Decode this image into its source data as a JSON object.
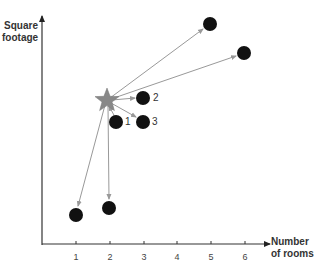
{
  "axes": {
    "y_label_line1": "Square",
    "y_label_line2": "footage",
    "x_label_line1": "Number",
    "x_label_line2": "of rooms",
    "x_ticks": [
      "1",
      "2",
      "3",
      "4",
      "5",
      "6"
    ]
  },
  "query_point": {
    "shape": "star",
    "color": "#888888",
    "x": 1.9,
    "note": "new data point"
  },
  "neighbor_labels": [
    "1",
    "2",
    "3"
  ],
  "points": [
    {
      "id": "top-right-a",
      "x": 5,
      "label": ""
    },
    {
      "id": "top-right-b",
      "x": 6,
      "label": ""
    },
    {
      "id": "neighbor-2",
      "x": 3,
      "label": "2"
    },
    {
      "id": "neighbor-1",
      "x": 2.2,
      "label": "1"
    },
    {
      "id": "neighbor-3",
      "x": 3,
      "label": "3"
    },
    {
      "id": "bottom-left-a",
      "x": 1,
      "label": ""
    },
    {
      "id": "bottom-left-b",
      "x": 2,
      "label": ""
    }
  ],
  "colors": {
    "point": "#111111",
    "arrow": "#999999",
    "axis": "#333333",
    "star": "#888888"
  }
}
